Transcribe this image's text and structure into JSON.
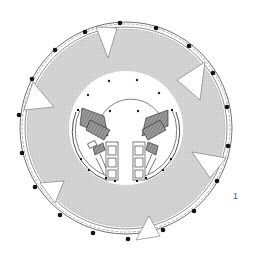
{
  "figure": {
    "type": "architectural-floor-plan",
    "label": "1",
    "colors": {
      "background": "#ffffff",
      "floor_fill": "#d4d4d4",
      "lines": "#222222",
      "core_hatch": "#888888"
    },
    "center": [
      126,
      128
    ],
    "outer_radius": 106,
    "facade_radius": 100,
    "atrium_radius": 57,
    "perimeter_columns": 18,
    "notches": 6,
    "atrium_columns": 6
  }
}
